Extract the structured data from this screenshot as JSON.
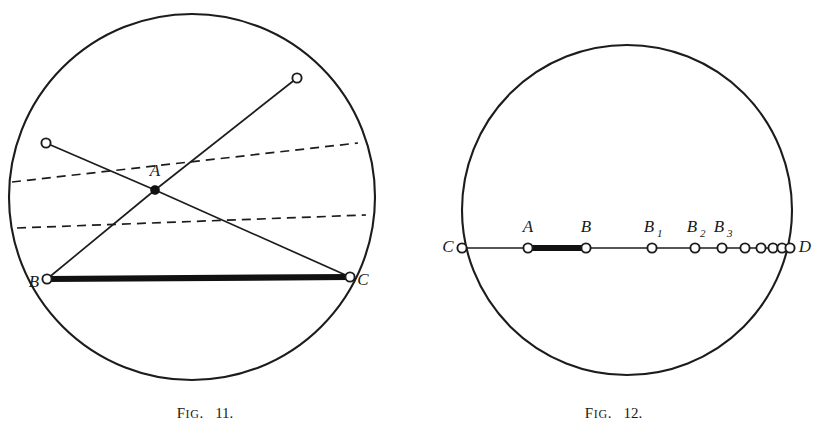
{
  "page": {
    "width": 817,
    "height": 448,
    "background": "#ffffff",
    "ink_color": "#1c1c1c"
  },
  "figures": [
    {
      "id": "fig-11",
      "caption_prefix": "F",
      "caption_prefix_rest": "IG",
      "caption_dot": ".",
      "caption_number": "11.",
      "caption_full": "FIG. 11.",
      "circle": {
        "cx": 192,
        "cy": 197,
        "r": 183
      },
      "points": [
        {
          "key": "A",
          "label": "A",
          "subscript": "",
          "x": 155,
          "y": 190,
          "style": "solid",
          "label_dx": 0,
          "label_dy": -14,
          "label_anchor": "middle"
        },
        {
          "key": "B",
          "label": "B",
          "subscript": "",
          "x": 47,
          "y": 279,
          "style": "open",
          "label_dx": -13,
          "label_dy": 8,
          "label_anchor": "middle"
        },
        {
          "key": "C",
          "label": "C",
          "subscript": "",
          "x": 350,
          "y": 277,
          "style": "open",
          "label_dx": 13,
          "label_dy": 8,
          "label_anchor": "middle"
        },
        {
          "key": "UL",
          "label": "",
          "subscript": "",
          "x": 46,
          "y": 143,
          "style": "open",
          "label_dx": 0,
          "label_dy": 0,
          "label_anchor": "middle"
        },
        {
          "key": "UR",
          "label": "",
          "subscript": "",
          "x": 297,
          "y": 78,
          "style": "open",
          "label_dx": 0,
          "label_dy": 0,
          "label_anchor": "middle"
        }
      ],
      "solid_chords": [
        {
          "from": "A",
          "to": "B"
        },
        {
          "from": "A",
          "to": "C"
        },
        {
          "from": "A",
          "to": "UL"
        },
        {
          "from": "A",
          "to": "UR"
        }
      ],
      "bold_chords": [
        {
          "from": "B",
          "to": "C"
        }
      ],
      "dashed_chords": [
        {
          "x1": 12,
          "y1": 182,
          "x2": 358,
          "y2": 143
        },
        {
          "x1": 17,
          "y1": 228,
          "x2": 366,
          "y2": 215
        }
      ]
    },
    {
      "id": "fig-12",
      "caption_prefix": "F",
      "caption_prefix_rest": "IG",
      "caption_dot": ".",
      "caption_number": "12.",
      "caption_full": "FIG. 12.",
      "circle": {
        "cx": 627,
        "cy": 210,
        "r": 165
      },
      "diameter": {
        "x1": 462,
        "y1": 248,
        "x2": 790,
        "y2": 248
      },
      "points": [
        {
          "key": "C",
          "label": "C",
          "subscript": "",
          "x": 462,
          "y": 248,
          "style": "open",
          "label_dx": -14,
          "label_dy": 4,
          "label_anchor": "middle"
        },
        {
          "key": "A",
          "label": "A",
          "subscript": "",
          "x": 528,
          "y": 248,
          "style": "open",
          "label_dx": 0,
          "label_dy": -16,
          "label_anchor": "middle"
        },
        {
          "key": "B",
          "label": "B",
          "subscript": "",
          "x": 586,
          "y": 248,
          "style": "open",
          "label_dx": 0,
          "label_dy": -16,
          "label_anchor": "middle"
        },
        {
          "key": "B1",
          "label": "B",
          "subscript": "1",
          "x": 652,
          "y": 248,
          "style": "open",
          "label_dx": -3,
          "label_dy": -16,
          "label_anchor": "middle"
        },
        {
          "key": "B2",
          "label": "B",
          "subscript": "2",
          "x": 695,
          "y": 248,
          "style": "open",
          "label_dx": -3,
          "label_dy": -16,
          "label_anchor": "middle"
        },
        {
          "key": "B3",
          "label": "B",
          "subscript": "3",
          "x": 722,
          "y": 248,
          "style": "open",
          "label_dx": -3,
          "label_dy": -16,
          "label_anchor": "middle"
        },
        {
          "key": "B4",
          "label": "",
          "subscript": "",
          "x": 745,
          "y": 248,
          "style": "open",
          "label_dx": 0,
          "label_dy": 0,
          "label_anchor": "middle"
        },
        {
          "key": "B5",
          "label": "",
          "subscript": "",
          "x": 761,
          "y": 248,
          "style": "open",
          "label_dx": 0,
          "label_dy": 0,
          "label_anchor": "middle"
        },
        {
          "key": "B6",
          "label": "",
          "subscript": "",
          "x": 773,
          "y": 248,
          "style": "open",
          "label_dx": 0,
          "label_dy": 0,
          "label_anchor": "middle"
        },
        {
          "key": "B7",
          "label": "",
          "subscript": "",
          "x": 782,
          "y": 248,
          "style": "open",
          "label_dx": 0,
          "label_dy": 0,
          "label_anchor": "middle"
        },
        {
          "key": "D",
          "label": "D",
          "subscript": "",
          "x": 790,
          "y": 248,
          "style": "open",
          "label_dx": 15,
          "label_dy": 4,
          "label_anchor": "middle"
        }
      ],
      "bold_segments": [
        {
          "from": "A",
          "to": "B"
        }
      ]
    }
  ]
}
